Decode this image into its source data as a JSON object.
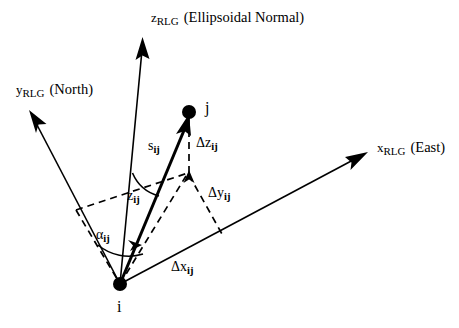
{
  "figure": {
    "background_color": "#ffffff",
    "line_color": "#000000"
  },
  "axes": [
    {
      "id": "z-axis",
      "symbol": "z",
      "subscript": "RLG",
      "annotation": "(Ellipsoidal Normal)",
      "direction": "up"
    },
    {
      "id": "y-axis",
      "symbol": "y",
      "subscript": "RLG",
      "annotation": "(North)",
      "direction": "upper-left"
    },
    {
      "id": "x-axis",
      "symbol": "x",
      "subscript": "RLG",
      "annotation": "(East)",
      "direction": "upper-right"
    }
  ],
  "points": [
    {
      "id": "point-i",
      "label": "i",
      "role": "origin-station"
    },
    {
      "id": "point-j",
      "label": "j",
      "role": "target-station"
    }
  ],
  "vectors": [
    {
      "id": "baseline-vector",
      "symbol": "s",
      "subscript": "ij",
      "style": "solid-bold",
      "from": "i",
      "to": "j"
    }
  ],
  "components": [
    {
      "id": "delta-x",
      "symbol": "Δx",
      "subscript": "ij",
      "style": "solid",
      "axis": "x"
    },
    {
      "id": "delta-y",
      "symbol": "Δy",
      "subscript": "ij",
      "style": "dashed",
      "axis": "y"
    },
    {
      "id": "delta-z",
      "symbol": "Δz",
      "subscript": "ij",
      "style": "dashed",
      "axis": "z"
    }
  ],
  "angles": [
    {
      "id": "azimuth-angle",
      "symbol": "α",
      "subscript": "ij",
      "name": "azimuth",
      "measured_from": "y-axis"
    },
    {
      "id": "zenith-angle",
      "symbol": "z",
      "subscript": "ij",
      "name": "zenith-angle",
      "measured_from": "z-axis"
    }
  ]
}
